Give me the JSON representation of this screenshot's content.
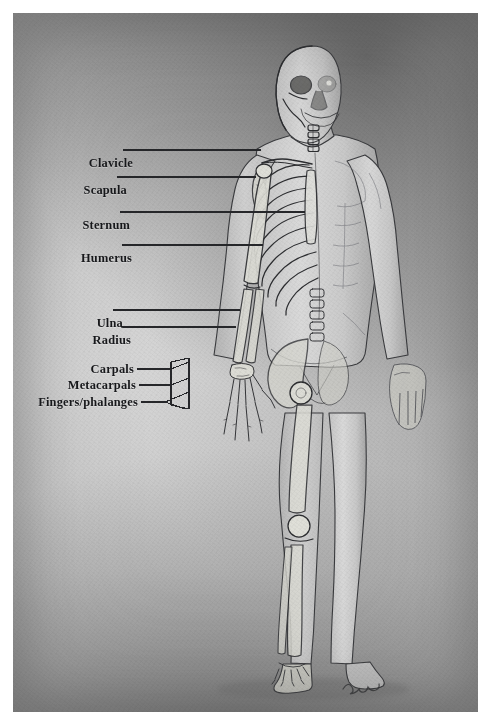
{
  "artwork": {
    "title": "Human Skeletal Anatomy Study",
    "medium_look": "graphite and wash drawing on textured paper",
    "subject": "standing male figure, anterior view, split anatomy",
    "description": "Left half of the body is rendered as skeleton, right half as skin and muscle",
    "signature": "Jared",
    "colors": {
      "paper_light": "#d6d6d6",
      "paper_mid": "#bdbdbd",
      "background_dark": "#6e6e6e",
      "ink": "#17181b",
      "leader_line": "#2a2b2e",
      "page_margin": "#ffffff"
    }
  },
  "labels": [
    {
      "id": "clavicle",
      "text": "Clavicle",
      "x": 120,
      "y": 150,
      "line_to_x": 248,
      "line_to_y": 150
    },
    {
      "id": "scapula",
      "text": "Scapula",
      "x": 114,
      "y": 177,
      "line_to_x": 243,
      "line_to_y": 177
    },
    {
      "id": "sternum",
      "text": "Sternum",
      "x": 117,
      "y": 212,
      "line_to_x": 288,
      "line_to_y": 212
    },
    {
      "id": "humerus",
      "text": "Humerus",
      "x": 119,
      "y": 245,
      "line_to_x": 246,
      "line_to_y": 245
    },
    {
      "id": "ulna",
      "text": "Ulna",
      "x": 110,
      "y": 310,
      "line_to_x": 225,
      "line_to_y": 310
    },
    {
      "id": "radius",
      "text": "Radius",
      "x": 118,
      "y": 327,
      "line_to_x": 221,
      "line_to_y": 327
    },
    {
      "id": "carpals",
      "text": "Carpals",
      "x": 131,
      "y": 369,
      "line_to_x": 181,
      "line_to_y": 369
    },
    {
      "id": "metacarpals",
      "text": "Metacarpals",
      "x": 133,
      "y": 385,
      "line_to_x": 181,
      "line_to_y": 385
    },
    {
      "id": "fingers-phalanges",
      "text": "Fingers/phalanges",
      "x": 136,
      "y": 402,
      "line_to_x": 181,
      "line_to_y": 402
    }
  ],
  "bone_groups": [
    {
      "id": "skull",
      "name": "Skull and cranium"
    },
    {
      "id": "spine",
      "name": "Vertebral column"
    },
    {
      "id": "ribcage",
      "name": "Rib cage"
    },
    {
      "id": "pelvis",
      "name": "Pelvis"
    },
    {
      "id": "arm",
      "name": "Upper limb"
    },
    {
      "id": "leg",
      "name": "Lower limb"
    },
    {
      "id": "hand",
      "name": "Hand"
    },
    {
      "id": "foot",
      "name": "Foot"
    }
  ]
}
